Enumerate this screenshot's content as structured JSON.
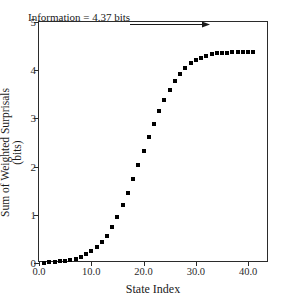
{
  "chart_data": {
    "type": "scatter",
    "title": "",
    "xlabel": "State Index",
    "ylabel": "Sum of Weighted Surprisals (bits)",
    "xlim": [
      0,
      44
    ],
    "ylim": [
      0,
      5
    ],
    "grid": false,
    "legend": null,
    "marker": "square",
    "marker_color": "#000000",
    "xticks": [
      "0.0",
      "10.0",
      "20.0",
      "30.0",
      "40.0"
    ],
    "xtick_values": [
      0,
      10,
      20,
      30,
      40
    ],
    "yticks": [
      "0",
      "1",
      "2",
      "3",
      "4",
      "5"
    ],
    "ytick_values": [
      0,
      1,
      2,
      3,
      4,
      5
    ],
    "annotations": [
      {
        "text": "Information = 4.37 bits",
        "arrow": "right-arrow",
        "x": 12,
        "y": 4.62
      }
    ],
    "x": [
      1,
      2,
      3,
      4,
      5,
      6,
      7,
      8,
      9,
      10,
      11,
      12,
      13,
      14,
      15,
      16,
      17,
      18,
      19,
      20,
      21,
      22,
      23,
      24,
      25,
      26,
      27,
      28,
      29,
      30,
      31,
      32,
      33,
      34,
      35,
      36,
      37,
      38,
      39,
      40,
      41
    ],
    "values": [
      0.01,
      0.02,
      0.03,
      0.04,
      0.05,
      0.07,
      0.09,
      0.13,
      0.18,
      0.25,
      0.33,
      0.43,
      0.56,
      0.74,
      0.96,
      1.2,
      1.46,
      1.74,
      2.03,
      2.32,
      2.61,
      2.89,
      3.15,
      3.38,
      3.59,
      3.77,
      3.93,
      4.05,
      4.14,
      4.21,
      4.26,
      4.3,
      4.33,
      4.35,
      4.36,
      4.365,
      4.37,
      4.37,
      4.37,
      4.37,
      4.37
    ]
  }
}
